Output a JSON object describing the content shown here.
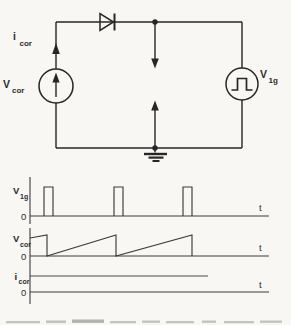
{
  "colors": {
    "background": "#f8f7f3",
    "circuit_ink": "#262626",
    "waveform_ink": "#3c3c3c",
    "text_ink": "#2d2d2d"
  },
  "circuit": {
    "current_label": {
      "main": "i",
      "sub": "cor"
    },
    "left_source_label": {
      "main": "V",
      "sub": "cor"
    },
    "right_source_label": {
      "main": "V",
      "sub": "1g"
    },
    "icons": [
      "diode-icon",
      "current-source-icon",
      "pulse-source-icon",
      "corona-gap-arrows-icon",
      "earth-ground-icon"
    ]
  },
  "waveforms": [
    {
      "id": "v1g",
      "label": {
        "main": "V",
        "sub": "1g"
      },
      "zero_label": "0",
      "time_label": "t",
      "type": "pulse-train",
      "base_y": 216,
      "high_y": 187,
      "pulses": [
        {
          "x0": 44,
          "x1": 53
        },
        {
          "x0": 114,
          "x1": 123
        },
        {
          "x0": 183,
          "x1": 192
        }
      ]
    },
    {
      "id": "vcor",
      "label": {
        "main": "V",
        "sub": "cor"
      },
      "zero_label": "0",
      "time_label": "t",
      "type": "sawtooth",
      "base_y": 256,
      "peak_y": 235,
      "reset_x": [
        47,
        116,
        192
      ],
      "points": [
        [
          30,
          238
        ],
        [
          47,
          235
        ],
        [
          47,
          256
        ],
        [
          116,
          235
        ],
        [
          116,
          256
        ],
        [
          192,
          235
        ],
        [
          192,
          256
        ]
      ]
    },
    {
      "id": "icor",
      "label": {
        "main": "i",
        "sub": "cor"
      },
      "zero_label": "0",
      "time_label": "t",
      "type": "constant-level",
      "base_y": 292,
      "level_y": 276,
      "points": [
        [
          30,
          276
        ],
        [
          208,
          276
        ]
      ]
    }
  ]
}
